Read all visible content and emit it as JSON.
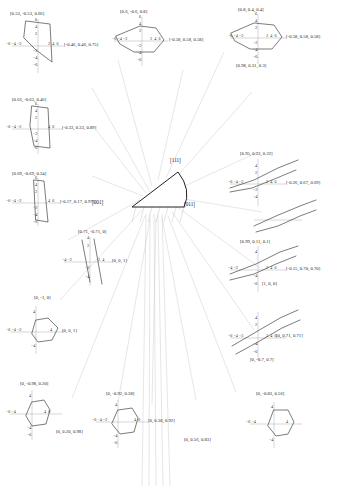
{
  "figure": {
    "type": "stereographic-triangle-inverse-pole-figure",
    "background": "#ffffff",
    "curve_color": "#2b2b2b",
    "axis_color": "#8d8d8d",
    "leader_color": "#c8c8c8"
  },
  "triangle": {
    "name": "standard-stereographic-triangle",
    "vertices": [
      {
        "label": "[001]",
        "position": "left"
      },
      {
        "label": "[011]",
        "position": "right"
      },
      {
        "label": "[111]",
        "position": "top"
      }
    ]
  },
  "axis_ticks": {
    "x_full": [
      "-6",
      "-4",
      "-2",
      "2",
      "4",
      "6"
    ],
    "x_short": [
      "-4",
      "-2",
      "2",
      "4"
    ],
    "y_full": [
      "6",
      "4",
      "2",
      "-2",
      "-4",
      "-6"
    ],
    "y_short": [
      "4",
      "2",
      "-2",
      "-4"
    ]
  },
  "insets": [
    {
      "id": "inset-01",
      "primary_label": "[0.53, -0.53, 0.66]",
      "secondary_label": "[-0.46, 0.46, 0.75]",
      "shape": "tall-polygon",
      "x_ticks": [
        "-6",
        "-4",
        "-2",
        "2",
        "4",
        "6"
      ],
      "y_ticks": [
        "6",
        "4",
        "2",
        "-2",
        "-4",
        "-6"
      ]
    },
    {
      "id": "inset-02",
      "primary_label": "[0.6, -0.6, 0.8]",
      "secondary_label": "[-0.58, 0.58, 0.58]",
      "shape": "flat-lens",
      "x_ticks": [
        "-6",
        "-4",
        "-2",
        "2",
        "4",
        "6"
      ],
      "y_ticks": [
        "6",
        "4",
        "2",
        "-2",
        "-4",
        "-6"
      ]
    },
    {
      "id": "inset-03",
      "primary_label": "[0.8, 0.4, 0.4]",
      "secondary_label": "[-0.58, 0.58, 0.58]",
      "tertiary_label": "[0.98, 0.31, 0.3]",
      "shape": "flat-lens",
      "x_ticks": [
        "-6",
        "-4",
        "-2",
        "2",
        "4",
        "6"
      ],
      "y_ticks": [
        "6",
        "4",
        "2",
        "-2",
        "-4",
        "-6"
      ]
    },
    {
      "id": "inset-04",
      "primary_label": "[0.63, -0.63, 0.46]",
      "secondary_label": "[-0.33, 0.33, 0.89]",
      "shape": "tall-polygon",
      "x_ticks": [
        "-6",
        "-4",
        "-2",
        "2",
        "4",
        "6"
      ],
      "y_ticks": [
        "6",
        "4",
        "2",
        "-2",
        "-4",
        "-6"
      ]
    },
    {
      "id": "inset-05",
      "primary_label": "[0.95, 0.23, 0.22]",
      "secondary_label": "[-0.26, 0.67, 0.69]",
      "shape": "shallow-slanted-lines",
      "x_ticks": [
        "-6",
        "-4",
        "-2",
        "2",
        "4",
        "6"
      ],
      "y_ticks": [
        "6",
        "4",
        "2",
        "-2",
        "-4",
        "-6"
      ]
    },
    {
      "id": "inset-06",
      "primary_label": "[0.69, -0.69, 0.24]",
      "secondary_label": "[-0.17, 0.17, 0.97]",
      "shape": "narrow-sliver",
      "x_ticks": [
        "-6",
        "-4",
        "-2",
        "2",
        "4",
        "6"
      ],
      "y_ticks": [
        "6",
        "4",
        "2",
        "-2",
        "-4",
        "-6"
      ]
    },
    {
      "id": "inset-07",
      "primary_label": "[0.71, -0.71, 0]",
      "secondary_label": "[0, 0, 1]",
      "shape": "narrow-sliver",
      "x_ticks": [
        "-4",
        "-2",
        "2",
        "4"
      ],
      "y_ticks": [
        "4",
        "2",
        "-2",
        "-4"
      ]
    },
    {
      "id": "inset-08",
      "primary_label": "[0.99, 0.11, 0.1]",
      "secondary_label": "[-0.15, 0.70, 0.70]",
      "tertiary_label": "[1, 0, 0]",
      "shape": "slanted-lines",
      "x_ticks": [
        "-6",
        "-4",
        "-2",
        "2",
        "4",
        "6"
      ],
      "y_ticks": [
        "4",
        "2",
        "-4",
        "-6"
      ]
    },
    {
      "id": "inset-09",
      "primary_label": "[0, -1, 0]",
      "secondary_label": "[0, 0, 1]",
      "shape": "hexagon",
      "x_ticks": [
        "-6",
        "-4",
        "-2",
        "2",
        "4",
        "6"
      ],
      "y_ticks": [
        "4",
        "2",
        "-2",
        "-4"
      ]
    },
    {
      "id": "inset-10",
      "primary_label": "[0, 0.71, 0.71]",
      "secondary_label": "[0, -0.7, 0.7]",
      "shape": "slanted-lines",
      "x_ticks": [
        "-6",
        "-4",
        "-2",
        "2",
        "4",
        "6"
      ],
      "y_ticks": [
        "4",
        "2",
        "-2",
        "-4",
        "-6"
      ]
    },
    {
      "id": "inset-11",
      "primary_label": "[0, -0.98, 0.20]",
      "secondary_label": "[0, 0.20, 0.98]",
      "shape": "hexagon",
      "x_ticks": [
        "-6",
        "-4",
        "-2",
        "2",
        "4",
        "6"
      ],
      "y_ticks": [
        "4",
        "2",
        "-2",
        "-4",
        "-6"
      ]
    },
    {
      "id": "inset-12",
      "primary_label": "[0, -0.92, 0.38]",
      "secondary_label": "[0, 0.38, 0.92]",
      "shape": "hexagon",
      "x_ticks": [
        "-6",
        "-4",
        "-2",
        "2",
        "4",
        "6"
      ],
      "y_ticks": [
        "4",
        "2",
        "-2",
        "-4",
        "-6"
      ]
    },
    {
      "id": "inset-13",
      "primary_label": "[0, -0.83, 0.56]",
      "secondary_label": "[0, 0.56, 0.83]",
      "shape": "hexagon",
      "x_ticks": [
        "-6",
        "-4",
        "-2",
        "2",
        "4",
        "6"
      ],
      "y_ticks": [
        "4",
        "2",
        "-2",
        "-4"
      ]
    },
    {
      "id": "inset-14",
      "primary_label": "[0, 0.71, 0.71]",
      "shape": "slanted-lines",
      "x_ticks": [
        "-6",
        "-4",
        "-2",
        "2",
        "4",
        "6"
      ],
      "y_ticks": [
        "4",
        "2",
        "-2",
        "-4",
        "-6"
      ]
    }
  ]
}
